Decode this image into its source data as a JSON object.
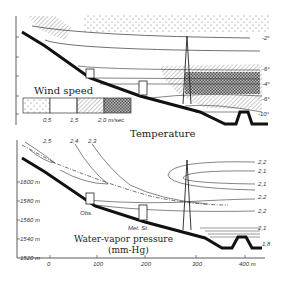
{
  "top_panel": {
    "title": "Temperature",
    "isotherm_labels": [
      "-2°",
      "-6°",
      "-4°",
      "-6°",
      "-8°",
      "-10°"
    ],
    "legend": {
      "title": "Wind speed",
      "ticks": [
        "0,5",
        "1,5",
        "2,0 m/sec."
      ],
      "patterns": [
        "dotted",
        "blank",
        "hatched",
        "cross-hatched"
      ]
    }
  },
  "bottom_panel": {
    "title_line1": "Water-vapor pressure",
    "title_line2": "(mm-Hg)",
    "isoline_labels_top": [
      "2,5",
      "2,4",
      "2,3"
    ],
    "isoline_labels_right": [
      "2,2",
      "2,1",
      "2,1",
      "2,2",
      "2,2",
      "2,1",
      "1,8"
    ],
    "site_labels": [
      "Obs.",
      "Met. St."
    ],
    "y_axis": [
      "1600 m",
      "1580 m",
      "1560 m",
      "1540 m",
      "1520 m"
    ],
    "x_axis": [
      "0",
      "100",
      "200",
      "300",
      "400 m"
    ]
  }
}
